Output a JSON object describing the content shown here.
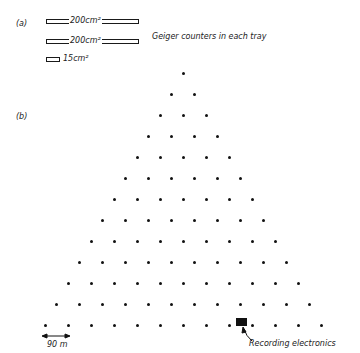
{
  "panel_a": {
    "label": "(a)",
    "trays": [
      {
        "area": "200 cm²",
        "text": "200cm²"
      },
      {
        "area": "200 cm²",
        "text": "200cm²"
      },
      {
        "area": "15 cm²",
        "text": "15cm²"
      }
    ],
    "caption": "Geiger counters in each tray"
  },
  "panel_b": {
    "label": "(b)",
    "rows": 13,
    "scale_label": "90 m",
    "electronics_label": "Recording electronics"
  },
  "colors": {
    "ink": "#111111",
    "background": "#ffffff"
  }
}
